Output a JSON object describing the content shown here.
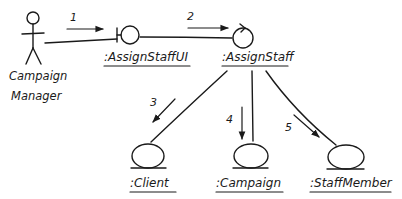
{
  "diagram": {
    "type": "UML communication diagram (hand-drawn)",
    "actor": {
      "name_line1": "Campaign",
      "name_line2": "Manager"
    },
    "objects": [
      {
        "id": "ui",
        "label": ":AssignStaffUI",
        "stereotype": "boundary"
      },
      {
        "id": "ctrl",
        "label": ":AssignStaff",
        "stereotype": "control"
      },
      {
        "id": "client",
        "label": ":Client",
        "stereotype": "entity"
      },
      {
        "id": "campaign",
        "label": ":Campaign",
        "stereotype": "entity"
      },
      {
        "id": "staff",
        "label": ":StaffMember",
        "stereotype": "entity"
      }
    ],
    "messages": [
      {
        "number": "1",
        "from": "Campaign Manager",
        "to": ":AssignStaffUI"
      },
      {
        "number": "2",
        "from": ":AssignStaffUI",
        "to": ":AssignStaff"
      },
      {
        "number": "3",
        "from": ":AssignStaff",
        "to": ":Client"
      },
      {
        "number": "4",
        "from": ":AssignStaff",
        "to": ":Campaign"
      },
      {
        "number": "5",
        "from": ":AssignStaff",
        "to": ":StaffMember"
      }
    ],
    "colors": {
      "ink": "#1a1a1a",
      "background": "#ffffff"
    }
  }
}
